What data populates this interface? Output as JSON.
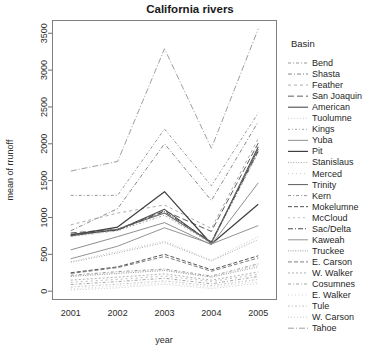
{
  "header": {
    "title": "California rivers"
  },
  "axes": {
    "x_label": "year",
    "y_label": "mean of  rrunoff",
    "x_ticks": [
      "2001",
      "2002",
      "2003",
      "2004",
      "2005"
    ],
    "y_ticks": [
      "0",
      "500",
      "1000",
      "1500",
      "2000",
      "2500",
      "3000",
      "3500"
    ],
    "x_range": [
      2000.6,
      2005.4
    ],
    "y_range": [
      -120,
      3680
    ]
  },
  "legend": {
    "title": "Basin",
    "position": "right",
    "entries": [
      {
        "label": "Bend",
        "dash": "3,2,1,2",
        "color": "#8c8c8c",
        "width": 0.9
      },
      {
        "label": "Shasta",
        "dash": "4,2,1,2",
        "color": "#7a7a7a",
        "width": 0.9
      },
      {
        "label": "Feather",
        "dash": "3,3",
        "color": "#a3a3a3",
        "width": 0.9
      },
      {
        "label": "San Joaquin",
        "dash": "6,3",
        "color": "#5e5e5e",
        "width": 1.0
      },
      {
        "label": "American",
        "dash": "none",
        "color": "#4d4d4d",
        "width": 1.1
      },
      {
        "label": "Tuolumne",
        "dash": "1,2",
        "color": "#bdbdbd",
        "width": 0.8
      },
      {
        "label": "Kings",
        "dash": "2,2,1,2",
        "color": "#9a9a9a",
        "width": 0.9
      },
      {
        "label": "Yuba",
        "dash": "none",
        "color": "#8f8f8f",
        "width": 1.0
      },
      {
        "label": "Pit",
        "dash": "none",
        "color": "#3f3f3f",
        "width": 1.2
      },
      {
        "label": "Stanislaus",
        "dash": "1,1.6",
        "color": "#9e9e9e",
        "width": 0.9
      },
      {
        "label": "Merced",
        "dash": "1,3",
        "color": "#c2c2c2",
        "width": 0.8
      },
      {
        "label": "Trinity",
        "dash": "none",
        "color": "#6b6b6b",
        "width": 1.1
      },
      {
        "label": "Kern",
        "dash": "3,2,1,2",
        "color": "#8a8a8a",
        "width": 0.9
      },
      {
        "label": "Mokelumne",
        "dash": "4,2",
        "color": "#575757",
        "width": 1.0
      },
      {
        "label": "McCloud",
        "dash": "2,3",
        "color": "#b0b0b0",
        "width": 0.8
      },
      {
        "label": "Sac/Delta",
        "dash": "5,2,1,2",
        "color": "#4a4a4a",
        "width": 1.0
      },
      {
        "label": "Kaweah",
        "dash": "none",
        "color": "#949494",
        "width": 1.0
      },
      {
        "label": "Truckee",
        "dash": "1,1.4",
        "color": "#8e8e8e",
        "width": 0.9
      },
      {
        "label": "E. Carson",
        "dash": "4,2",
        "color": "#6f6f6f",
        "width": 0.9
      },
      {
        "label": "W. Walker",
        "dash": "2,2",
        "color": "#a8a8a8",
        "width": 0.9
      },
      {
        "label": "Cosumnes",
        "dash": "3,2,1,2",
        "color": "#9c9c9c",
        "width": 0.9
      },
      {
        "label": "E. Walker",
        "dash": "1,2.5",
        "color": "#c8c8c8",
        "width": 0.8
      },
      {
        "label": "Tule",
        "dash": "2,2,1,2",
        "color": "#b4b4b4",
        "width": 0.8
      },
      {
        "label": "W. Carson",
        "dash": "1,2",
        "color": "#bcbcbc",
        "width": 0.8
      },
      {
        "label": "Tahoe",
        "dash": "6,2,1,2",
        "color": "#9e9e9e",
        "width": 1.0
      }
    ]
  },
  "chart_data": {
    "type": "line",
    "title": "California rivers",
    "xlabel": "year",
    "ylabel": "mean of  rrunoff",
    "x": [
      2001,
      2002,
      2003,
      2004,
      2005
    ],
    "categories": [
      "2001",
      "2002",
      "2003",
      "2004",
      "2005"
    ],
    "xlim": [
      2000.6,
      2005.4
    ],
    "ylim": [
      -120,
      3680
    ],
    "grid": false,
    "legend_position": "right",
    "legend_title": "Basin",
    "series": [
      {
        "name": "Tahoe",
        "values": [
          1630,
          1760,
          3290,
          1940,
          3560
        ]
      },
      {
        "name": "Bend",
        "values": [
          1300,
          1300,
          2200,
          1430,
          2420
        ]
      },
      {
        "name": "Shasta",
        "values": [
          820,
          1120,
          2000,
          1230,
          2300
        ]
      },
      {
        "name": "Feather",
        "values": [
          900,
          1060,
          1170,
          850,
          2070
        ]
      },
      {
        "name": "San Joaquin",
        "values": [
          790,
          840,
          1090,
          810,
          2010
        ]
      },
      {
        "name": "Pit",
        "values": [
          760,
          870,
          1350,
          640,
          1180
        ]
      },
      {
        "name": "American",
        "values": [
          770,
          830,
          1110,
          650,
          1960
        ]
      },
      {
        "name": "Trinity",
        "values": [
          750,
          840,
          1060,
          660,
          1930
        ]
      },
      {
        "name": "Kings",
        "values": [
          740,
          820,
          1030,
          650,
          1880
        ]
      },
      {
        "name": "Sac/Delta",
        "values": [
          760,
          830,
          1080,
          670,
          1900
        ]
      },
      {
        "name": "Yuba",
        "values": [
          560,
          740,
          930,
          630,
          1470
        ]
      },
      {
        "name": "Kaweah",
        "values": [
          440,
          610,
          860,
          640,
          890
        ]
      },
      {
        "name": "Tuolumne",
        "values": [
          400,
          540,
          680,
          420,
          740
        ]
      },
      {
        "name": "Stanislaus",
        "values": [
          390,
          520,
          660,
          410,
          700
        ]
      },
      {
        "name": "Mokelumne",
        "values": [
          250,
          330,
          500,
          290,
          480
        ]
      },
      {
        "name": "E. Carson",
        "values": [
          240,
          320,
          470,
          270,
          450
        ]
      },
      {
        "name": "Kern",
        "values": [
          215,
          265,
          300,
          205,
          370
        ]
      },
      {
        "name": "Merced",
        "values": [
          205,
          250,
          290,
          195,
          350
        ]
      },
      {
        "name": "Truckee",
        "values": [
          200,
          240,
          280,
          190,
          330
        ]
      },
      {
        "name": "W. Walker",
        "values": [
          150,
          190,
          235,
          150,
          260
        ]
      },
      {
        "name": "McCloud",
        "values": [
          120,
          160,
          205,
          130,
          230
        ]
      },
      {
        "name": "Cosumnes",
        "values": [
          90,
          130,
          175,
          100,
          200
        ]
      },
      {
        "name": "Tule",
        "values": [
          55,
          95,
          140,
          75,
          160
        ]
      },
      {
        "name": "E. Walker",
        "values": [
          30,
          70,
          115,
          55,
          130
        ]
      },
      {
        "name": "W. Carson",
        "values": [
          15,
          45,
          95,
          35,
          105
        ]
      }
    ]
  },
  "plot_geometry": {
    "left": 52,
    "right": 277,
    "top": 20,
    "bottom": 300
  }
}
